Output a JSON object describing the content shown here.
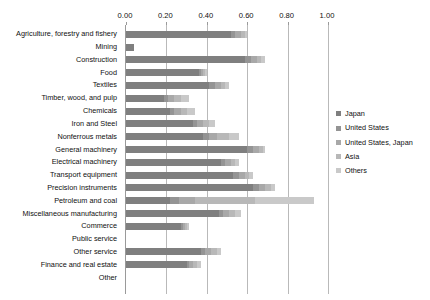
{
  "chart_data": {
    "type": "bar",
    "orientation": "horizontal",
    "stacked": true,
    "title": "",
    "xlabel": "",
    "ylabel": "",
    "xlim": [
      0.0,
      1.0
    ],
    "xticks": [
      "0.00",
      "0.20",
      "0.40",
      "0.60",
      "0.80",
      "1.00"
    ],
    "xtick_values": [
      0.0,
      0.2,
      0.4,
      0.6,
      0.8,
      1.0
    ],
    "grid": true,
    "legend_position": "right",
    "categories": [
      "Agriculture, forestry and fishery",
      "Mining",
      "Construction",
      "Food",
      "Textiles",
      "Timber, wood, and pulp",
      "Chemicals",
      "Iron and Steel",
      "Nonferrous metals",
      "General machinery",
      "Electrical machinery",
      "Transport equipment",
      "Precision instruments",
      "Petroleum and coal",
      "Miscellaneous manufacturing",
      "Commerce",
      "Public service",
      "Other service",
      "Finance and real estate",
      "Other"
    ],
    "series": [
      {
        "name": "Japan",
        "color": "#7f7f7f",
        "values": [
          0.52,
          0.04,
          0.59,
          0.36,
          0.41,
          0.19,
          0.22,
          0.33,
          0.38,
          0.6,
          0.47,
          0.53,
          0.63,
          0.22,
          0.46,
          0.27,
          0.0,
          0.37,
          0.3,
          0.0
        ]
      },
      {
        "name": "United States",
        "color": "#949494",
        "values": [
          0.02,
          0.0,
          0.03,
          0.01,
          0.03,
          0.02,
          0.02,
          0.02,
          0.03,
          0.03,
          0.02,
          0.03,
          0.03,
          0.04,
          0.02,
          0.01,
          0.0,
          0.02,
          0.01,
          0.0
        ]
      },
      {
        "name": "United States, Japan",
        "color": "#a8a8a8",
        "values": [
          0.03,
          0.0,
          0.03,
          0.01,
          0.03,
          0.03,
          0.03,
          0.03,
          0.04,
          0.03,
          0.03,
          0.03,
          0.03,
          0.08,
          0.03,
          0.01,
          0.0,
          0.03,
          0.02,
          0.0
        ]
      },
      {
        "name": "Asia",
        "color": "#b8b8b8",
        "values": [
          0.02,
          0.0,
          0.02,
          0.01,
          0.02,
          0.03,
          0.03,
          0.03,
          0.06,
          0.02,
          0.02,
          0.02,
          0.03,
          0.3,
          0.03,
          0.01,
          0.0,
          0.03,
          0.02,
          0.0
        ]
      },
      {
        "name": "Others",
        "color": "#c9c9c9",
        "values": [
          0.01,
          0.0,
          0.02,
          0.01,
          0.02,
          0.04,
          0.04,
          0.03,
          0.05,
          0.01,
          0.02,
          0.02,
          0.02,
          0.29,
          0.03,
          0.01,
          0.0,
          0.02,
          0.02,
          0.0
        ]
      }
    ],
    "totals": [
      0.6,
      0.04,
      0.69,
      0.4,
      0.51,
      0.31,
      0.34,
      0.44,
      0.56,
      0.69,
      0.56,
      0.63,
      0.74,
      0.93,
      0.57,
      0.31,
      0.0,
      0.47,
      0.37,
      0.0
    ]
  },
  "legend": {
    "items": [
      {
        "label": "Japan",
        "color": "#7f7f7f"
      },
      {
        "label": "United States",
        "color": "#949494"
      },
      {
        "label": "United States, Japan",
        "color": "#a8a8a8"
      },
      {
        "label": "Asia",
        "color": "#b8b8b8"
      },
      {
        "label": "Others",
        "color": "#c9c9c9"
      }
    ]
  }
}
